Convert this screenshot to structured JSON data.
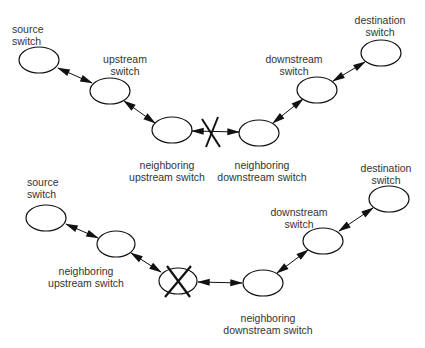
{
  "diagrams": [
    {
      "id": "link-failure",
      "nodes": [
        {
          "id": "t-src",
          "label_line1": "source",
          "label_line2": "switch",
          "cx": 39,
          "cy": 60
        },
        {
          "id": "t-up",
          "label_line1": "upstream",
          "label_line2": "switch",
          "cx": 110,
          "cy": 91
        },
        {
          "id": "t-nup",
          "label_line1": "neighboring",
          "label_line2": "upstream switch",
          "cx": 172,
          "cy": 130
        },
        {
          "id": "t-ndown",
          "label_line1": "neighboring",
          "label_line2": "downstream switch",
          "cx": 259,
          "cy": 133
        },
        {
          "id": "t-down",
          "label_line1": "downstream",
          "label_line2": "switch",
          "cx": 317,
          "cy": 90
        },
        {
          "id": "t-dst",
          "label_line1": "destination",
          "label_line2": "switch",
          "cx": 381,
          "cy": 53
        }
      ],
      "failed_element": "link between neighboring upstream switch and neighboring downstream switch"
    },
    {
      "id": "switch-failure",
      "nodes": [
        {
          "id": "b-src",
          "label_line1": "source",
          "label_line2": "switch",
          "cx": 46,
          "cy": 218
        },
        {
          "id": "b-nup",
          "label_line1": "neighboring",
          "label_line2": "upstream switch",
          "cx": 116,
          "cy": 244
        },
        {
          "id": "b-fail",
          "label_line1": "",
          "label_line2": "",
          "cx": 178,
          "cy": 281
        },
        {
          "id": "b-ndown",
          "label_line1": "neighboring",
          "label_line2": "downstream switch",
          "cx": 263,
          "cy": 283
        },
        {
          "id": "b-down",
          "label_line1": "downstream",
          "label_line2": "switch",
          "cx": 323,
          "cy": 241
        },
        {
          "id": "b-dst",
          "label_line1": "destination",
          "label_line2": "switch",
          "cx": 389,
          "cy": 199
        }
      ],
      "failed_element": "switch between neighboring upstream switch and neighboring downstream switch"
    }
  ],
  "colors": {
    "stroke": "#111111",
    "text": "#333333",
    "background": "#ffffff"
  }
}
